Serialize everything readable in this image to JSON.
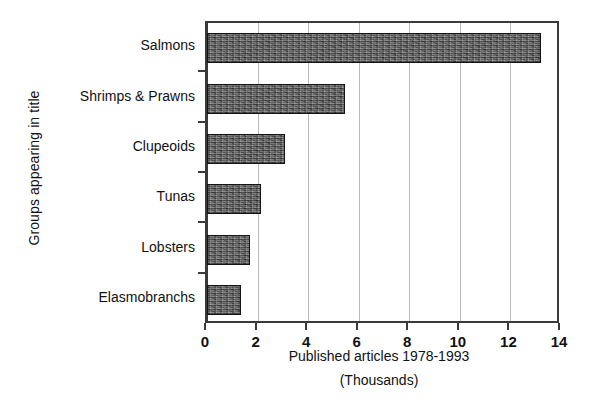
{
  "chart_data": {
    "type": "bar",
    "orientation": "horizontal",
    "title": "",
    "xlabel": "Published articles 1978-1993",
    "xlabel_sub": "(Thousands)",
    "ylabel": "Groups appearing in title",
    "categories": [
      "Salmons",
      "Shrimps & Prawns",
      "Clupeoids",
      "Tunas",
      "Lobsters",
      "Elasmobranchs"
    ],
    "values": [
      13.2,
      5.45,
      3.1,
      2.15,
      1.7,
      1.35
    ],
    "xlim": [
      0,
      14
    ],
    "xticks": [
      0,
      2,
      4,
      6,
      8,
      10,
      12,
      14
    ],
    "xticklabels": [
      "0",
      "2",
      "4",
      "6",
      "8",
      "10",
      "12",
      "14"
    ],
    "grid": "vertical",
    "legend": "none",
    "bar_fill_color": "#6e6e6e",
    "bar_edge_color": "#141414",
    "axis_color": "#3a3a3a",
    "gridline_color": "#b9b9b9",
    "background_color": "#ffffff"
  }
}
